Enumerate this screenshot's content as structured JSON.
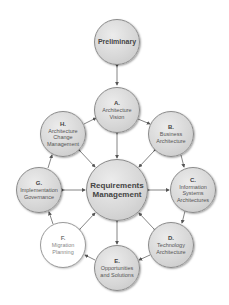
{
  "diagram": {
    "nodes": {
      "preliminary": {
        "letter": "",
        "label": "Preliminary",
        "cx": 117,
        "cy": 42,
        "r": 23,
        "style": "gray"
      },
      "a": {
        "letter": "A.",
        "label": "Architecture Vision",
        "cx": 117,
        "cy": 110,
        "r": 23,
        "style": "gray"
      },
      "b": {
        "letter": "B.",
        "label": "Business Architecture",
        "cx": 171,
        "cy": 134,
        "r": 23,
        "style": "gray"
      },
      "c": {
        "letter": "C.",
        "label": "Information Systems Architectures",
        "cx": 193,
        "cy": 190,
        "r": 23,
        "style": "gray"
      },
      "d": {
        "letter": "D.",
        "label": "Technology Architecture",
        "cx": 171,
        "cy": 245,
        "r": 23,
        "style": "gray"
      },
      "e": {
        "letter": "E.",
        "label": "Opportunities and Solutions",
        "cx": 117,
        "cy": 268,
        "r": 23,
        "style": "gray"
      },
      "f": {
        "letter": "F.",
        "label": "Migration Planning",
        "cx": 63,
        "cy": 245,
        "r": 23,
        "style": "white"
      },
      "g": {
        "letter": "G.",
        "label": "Implementation Governance",
        "cx": 39,
        "cy": 190,
        "r": 23,
        "style": "gray"
      },
      "h": {
        "letter": "H.",
        "label": "Architecture Change Management",
        "cx": 63,
        "cy": 134,
        "r": 23,
        "style": "gray"
      },
      "requirements": {
        "letter": "",
        "label": "Requirements Management",
        "cx": 117,
        "cy": 190,
        "r": 31,
        "style": "gray"
      }
    },
    "colors": {
      "node_fill": "#d6d6d6",
      "node_border": "#8a8a8a",
      "highlight_fill": "#ffffff",
      "arrow": "#555555",
      "text": "#555555"
    }
  }
}
